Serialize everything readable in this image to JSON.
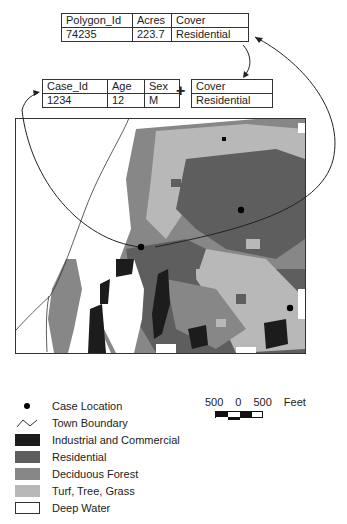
{
  "polygon_table": {
    "headers": [
      "Polygon_Id",
      "Acres",
      "Cover"
    ],
    "row": [
      "74235",
      "223.7",
      "Residential"
    ]
  },
  "case_table": {
    "headers": [
      "Case_Id",
      "Age",
      "Sex"
    ],
    "row": [
      "1234",
      "12",
      "M"
    ]
  },
  "join_operator": "+",
  "cover_table": {
    "header": "Cover",
    "value": "Residential"
  },
  "legend": {
    "items": [
      {
        "label": "Case Location",
        "symbol": "dot"
      },
      {
        "label": "Town Boundary",
        "symbol": "line"
      },
      {
        "label": "Industrial and Commercial",
        "color": "#1c1c1c"
      },
      {
        "label": "Residential",
        "color": "#5e5e5e"
      },
      {
        "label": "Deciduous Forest",
        "color": "#878787"
      },
      {
        "label": "Turf, Tree, Grass",
        "color": "#b8b8b8"
      },
      {
        "label": "Deep Water",
        "color": "#ffffff"
      }
    ]
  },
  "scale": {
    "labels": [
      "500",
      "0",
      "500",
      "Feet"
    ]
  },
  "map": {
    "case_locations": [
      {
        "x": 241,
        "y": 210
      },
      {
        "x": 141,
        "y": 247
      },
      {
        "x": 290,
        "y": 308
      },
      {
        "x": 224,
        "y": 139
      }
    ]
  }
}
